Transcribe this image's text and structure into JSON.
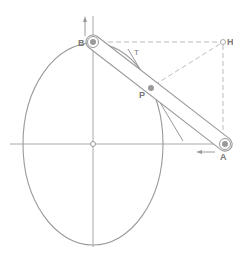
{
  "diagram": {
    "labels": {
      "B": "B",
      "A": "A",
      "P": "P",
      "H": "H",
      "T": "T"
    },
    "colors": {
      "line": "#9a9a9a",
      "dashed": "#bdbdbd",
      "label": "#777777",
      "background": "#ffffff"
    },
    "points": {
      "B": [
        93,
        42
      ],
      "A": [
        225,
        144
      ],
      "P": [
        151,
        88
      ],
      "H": [
        223,
        42
      ],
      "center": [
        93,
        144
      ]
    },
    "ellipse": {
      "cx": 93,
      "cy": 144,
      "rx": 70,
      "ry": 101
    }
  }
}
